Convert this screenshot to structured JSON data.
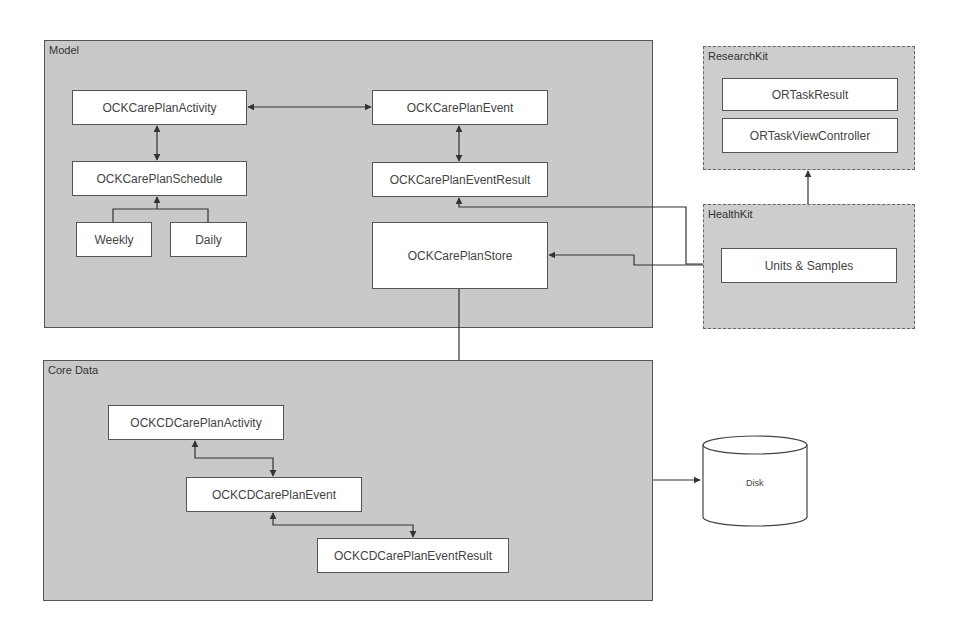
{
  "groups": {
    "model": "Model",
    "core_data": "Core Data",
    "research_kit": "ResearchKit",
    "health_kit": "HealthKit"
  },
  "nodes": {
    "ock_care_plan_activity": "OCKCarePlanActivity",
    "ock_care_plan_event": "OCKCarePlanEvent",
    "ock_care_plan_schedule": "OCKCarePlanSchedule",
    "ock_care_plan_event_result": "OCKCarePlanEventResult",
    "weekly": "Weekly",
    "daily": "Daily",
    "ock_care_plan_store": "OCKCarePlanStore",
    "or_task_result": "ORTaskResult",
    "or_task_view_controller": "ORTaskViewController",
    "units_samples": "Units & Samples",
    "ockcd_care_plan_activity": "OCKCDCarePlanActivity",
    "ockcd_care_plan_event": "OCKCDCarePlanEvent",
    "ockcd_care_plan_event_result": "OCKCDCarePlanEventResult",
    "disk": "Disk"
  }
}
